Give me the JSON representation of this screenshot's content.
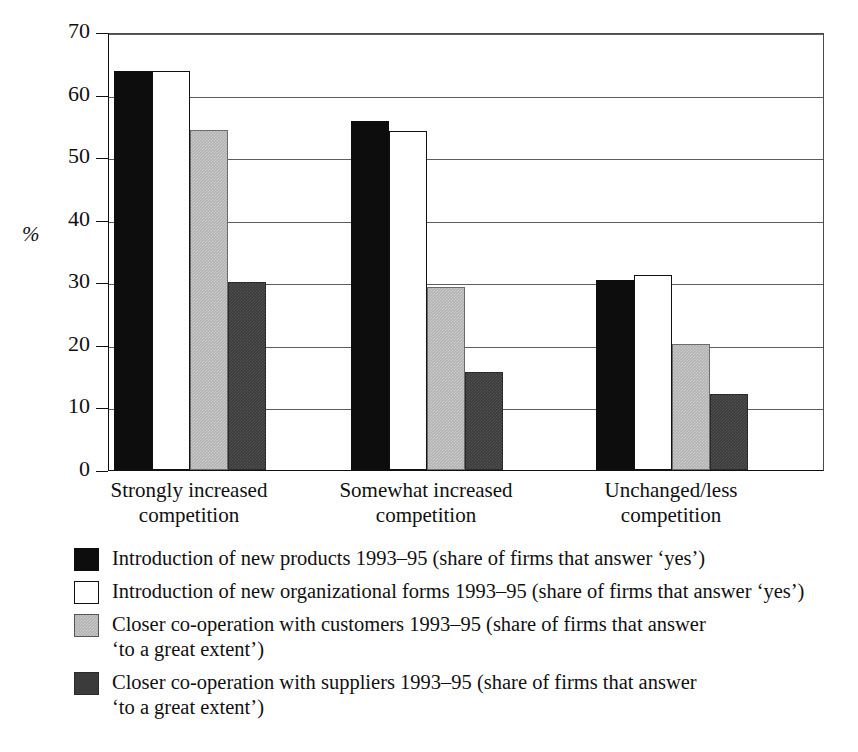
{
  "chart_data": {
    "type": "bar",
    "title": "",
    "xlabel": "",
    "ylabel": "%",
    "ylim": [
      0,
      70
    ],
    "yticks": [
      0,
      10,
      20,
      30,
      40,
      50,
      60,
      70
    ],
    "grid": true,
    "legend_position": "below",
    "categories": [
      "Strongly increased\ncompetition",
      "Somewhat increased\ncompetition",
      "Unchanged/less\ncompetition"
    ],
    "series": [
      {
        "name": "Introduction of new products 1993–95 (share of firms that answer ‘yes’)",
        "color": "#0d0d0d",
        "values": [
          63.8,
          55.8,
          30.4
        ]
      },
      {
        "name": "Introduction of new organizational forms 1993–95 (share of firms that answer ‘yes’)",
        "color": "#ffffff",
        "values": [
          63.8,
          54.2,
          31.2
        ]
      },
      {
        "name": "Closer co-operation with customers 1993–95 (share of firms that answer\n‘to a great extent’)",
        "color": "#b2b2b2",
        "values": [
          54.3,
          29.2,
          20.2
        ]
      },
      {
        "name": "Closer co-operation with suppliers 1993–95 (share of firms that answer\n‘to a great extent’)",
        "color": "#3b3b3b",
        "values": [
          30.0,
          15.6,
          12.2
        ]
      }
    ]
  },
  "axis": {
    "y_title": "%",
    "tick_labels": [
      "70",
      "60",
      "50",
      "40",
      "30",
      "20",
      "10",
      "0"
    ]
  },
  "legend": {
    "items": [
      {
        "swatch": "black-swatch",
        "label": "Introduction of new products 1993–95 (share of firms that answer ‘yes’)"
      },
      {
        "swatch": "white-swatch",
        "label": "Introduction of new organizational forms 1993–95 (share of firms that answer ‘yes’)"
      },
      {
        "swatch": "light-gray-swatch",
        "label": "Closer co-operation with customers 1993–95 (share of firms that answer\n‘to a great extent’)"
      },
      {
        "swatch": "dark-gray-swatch",
        "label": "Closer co-operation with suppliers 1993–95 (share of firms that answer\n‘to a great extent’)"
      }
    ]
  }
}
